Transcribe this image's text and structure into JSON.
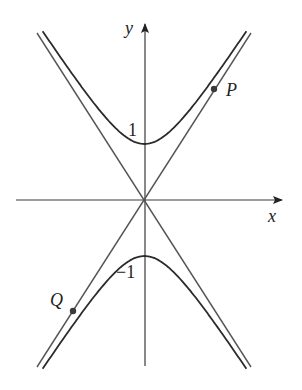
{
  "figure": {
    "axes": {
      "x_label": "x",
      "y_label": "y"
    },
    "ticks": {
      "y_pos": "1",
      "y_neg": "−1"
    },
    "points": {
      "p_label": "P",
      "q_label": "Q"
    },
    "colors": {
      "axis": "#3a3a3a",
      "curve": "#2b2b2b",
      "asymptote": "#555555",
      "background": "#ffffff"
    }
  }
}
